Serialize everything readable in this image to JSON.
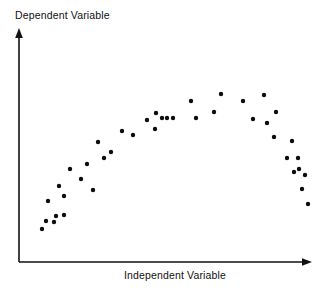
{
  "chart_data": {
    "type": "scatter",
    "title": "",
    "subtitle": "",
    "xlabel": "Independent Variable",
    "ylabel": "Dependent Variable",
    "relationship": "curvilinear inverted-U",
    "grid": false,
    "legend": null,
    "legend_position": "none",
    "xlim": [
      0,
      100
    ],
    "ylim": [
      0,
      100
    ],
    "xticks": [],
    "yticks": [],
    "xticklabels": [],
    "yticklabels": [],
    "annotations": [],
    "marker": {
      "shape": "circle",
      "color": "#0d0d0d",
      "size_px": 4.4
    },
    "axes_style": {
      "spines": [
        "left",
        "bottom"
      ],
      "arrow_tips": true,
      "color": "#111111"
    },
    "series": [
      {
        "name": "observations",
        "color": "#0d0d0d",
        "n_points": 57,
        "points": [
          [
            7.0,
            13.6
          ],
          [
            9.4,
            20.1
          ],
          [
            12.2,
            20.3
          ],
          [
            10.6,
            31.6
          ],
          [
            14.6,
            27.0
          ],
          [
            16.4,
            40.0
          ],
          [
            17.6,
            33.6
          ],
          [
            19.8,
            45.6
          ],
          [
            23.2,
            38.2
          ],
          [
            25.6,
            45.0
          ],
          [
            28.4,
            57.6
          ],
          [
            32.8,
            52.8
          ],
          [
            36.8,
            62.0
          ],
          [
            40.4,
            60.4
          ],
          [
            45.2,
            67.4
          ],
          [
            48.0,
            63.4
          ],
          [
            48.4,
            70.8
          ],
          [
            50.4,
            68.6
          ],
          [
            50.8,
            68.6
          ],
          [
            54.2,
            68.6
          ],
          [
            56.2,
            68.6
          ],
          [
            60.6,
            76.6
          ],
          [
            62.4,
            68.6
          ],
          [
            68.8,
            65.8
          ],
          [
            74.0,
            76.6
          ],
          [
            79.6,
            82.0
          ],
          [
            87.4,
            76.6
          ],
          [
            90.6,
            66.0
          ],
          [
            95.4,
            82.4
          ],
          [
            96.4,
            62.4
          ],
          [
            99.0,
            68.6
          ],
          [
            98.4,
            56.0
          ],
          [
            105.0,
            52.0
          ],
          [
            107.4,
            45.4
          ],
          [
            111.0,
            39.6
          ],
          [
            109.0,
            33.0
          ],
          [
            114.2,
            33.0
          ],
          [
            116.0,
            25.0
          ],
          [
            118.6,
            27.4
          ],
          [
            117.0,
            18.6
          ],
          [
            120.0,
            12.0
          ]
        ],
        "points_px": [
          [
            42,
            229
          ],
          [
            46,
            221
          ],
          [
            54,
            222
          ],
          [
            48,
            201
          ],
          [
            56,
            216
          ],
          [
            59,
            186
          ],
          [
            64,
            196
          ],
          [
            64,
            215
          ],
          [
            70,
            169
          ],
          [
            81,
            179
          ],
          [
            87,
            164
          ],
          [
            98,
            142
          ],
          [
            111,
            152
          ],
          [
            122,
            131
          ],
          [
            133,
            135
          ],
          [
            147,
            120
          ],
          [
            155,
            129
          ],
          [
            156,
            113
          ],
          [
            162,
            118
          ],
          [
            167,
            118
          ],
          [
            173,
            118
          ],
          [
            191,
            101
          ],
          [
            196,
            118
          ],
          [
            214,
            112
          ],
          [
            221,
            94
          ],
          [
            243,
            101
          ],
          [
            253,
            119
          ],
          [
            264,
            95
          ],
          [
            267,
            123
          ],
          [
            274,
            137
          ],
          [
            276,
            112
          ],
          [
            287,
            158
          ],
          [
            292,
            141
          ],
          [
            294,
            172
          ],
          [
            298,
            158
          ],
          [
            299,
            169
          ],
          [
            302,
            189
          ],
          [
            305,
            175
          ],
          [
            308,
            204
          ],
          [
            104,
            158
          ],
          [
            93,
            190
          ]
        ]
      }
    ]
  },
  "figure": {
    "width_px": 330,
    "height_px": 290,
    "background": "#ffffff",
    "foreground": "#111111"
  },
  "axes": {
    "y_axis_label": "Dependent Variable",
    "x_axis_label": "Independent Variable"
  }
}
